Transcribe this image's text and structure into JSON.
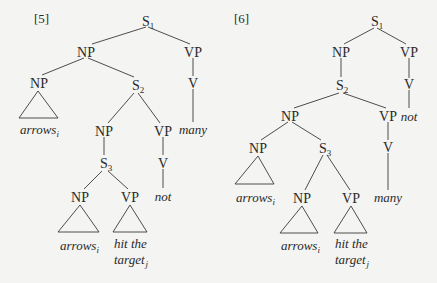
{
  "figure": {
    "trees": [
      {
        "id": "5",
        "label": "[5]",
        "nodes": {
          "s1": {
            "cat": "S",
            "sub": "1"
          },
          "np_top": {
            "cat": "NP"
          },
          "vp_top": {
            "cat": "VP"
          },
          "np_left": {
            "cat": "NP"
          },
          "s2": {
            "cat": "S",
            "sub": "2"
          },
          "v_top": {
            "cat": "V"
          },
          "np_mid": {
            "cat": "NP"
          },
          "vp_mid": {
            "cat": "VP"
          },
          "s3": {
            "cat": "S",
            "sub": "3"
          },
          "v_mid": {
            "cat": "V"
          },
          "np_low": {
            "cat": "NP"
          },
          "vp_low": {
            "cat": "VP"
          }
        },
        "leaves": {
          "arrows_top": {
            "word": "arrows",
            "sub": "i"
          },
          "many": {
            "word": "many"
          },
          "not": {
            "word": "not"
          },
          "arrows_low": {
            "word": "arrows",
            "sub": "i"
          },
          "hit_line1": {
            "word": "hit the"
          },
          "hit_line2": {
            "word": "target",
            "sub": "j"
          }
        }
      },
      {
        "id": "6",
        "label": "[6]",
        "nodes": {
          "s1": {
            "cat": "S",
            "sub": "1"
          },
          "np_top": {
            "cat": "NP"
          },
          "vp_top": {
            "cat": "VP"
          },
          "s2": {
            "cat": "S",
            "sub": "2"
          },
          "v_top": {
            "cat": "V"
          },
          "np_mid": {
            "cat": "NP"
          },
          "vp_mid": {
            "cat": "VP"
          },
          "np_left": {
            "cat": "NP"
          },
          "s3": {
            "cat": "S",
            "sub": "3"
          },
          "v_mid": {
            "cat": "V"
          },
          "np_low": {
            "cat": "NP"
          },
          "vp_low": {
            "cat": "VP"
          }
        },
        "leaves": {
          "not": {
            "word": "not"
          },
          "arrows_top": {
            "word": "arrows",
            "sub": "i"
          },
          "many": {
            "word": "many"
          },
          "arrows_low": {
            "word": "arrows",
            "sub": "i"
          },
          "hit_line1": {
            "word": "hit the"
          },
          "hit_line2": {
            "word": "target",
            "sub": "j"
          }
        }
      }
    ]
  }
}
